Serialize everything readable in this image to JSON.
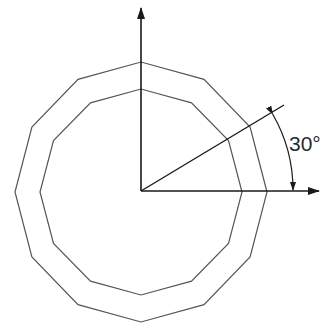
{
  "diagram": {
    "type": "geometric-construction",
    "angle_label": "30°",
    "angle_degrees": 30,
    "polygon_sides": 12,
    "colors": {
      "axis": "#1a1a1a",
      "polygon": "#555555",
      "background": "#ffffff"
    }
  }
}
